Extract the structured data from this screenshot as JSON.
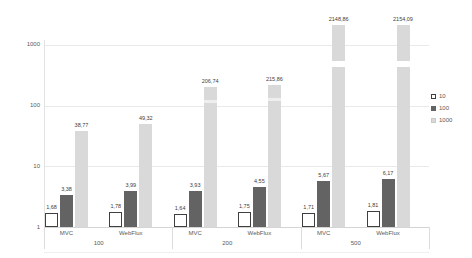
{
  "chart_data": {
    "type": "bar",
    "title": "",
    "xlabel": "",
    "ylabel": "",
    "y_axis": {
      "scale": "log10",
      "min": 1,
      "max": 3000,
      "tick_values": [
        1,
        10,
        100,
        1000
      ],
      "tick_labels": [
        "1",
        "10",
        "100",
        "1000"
      ]
    },
    "grid": "horizontal",
    "legend_position": "right",
    "series": [
      {
        "name": "10",
        "fill": "#ffffff",
        "stroke": "#3f3f3f"
      },
      {
        "name": "100",
        "fill": "#636363",
        "stroke": "#636363"
      },
      {
        "name": "1000",
        "fill": "#d9d9d9",
        "stroke": "#c9c9c9"
      }
    ],
    "groups": [
      {
        "label": "100",
        "subgroups": [
          {
            "label": "MVC",
            "values": [
              1.68,
              3.38,
              38.77
            ],
            "value_labels": [
              "1,68",
              "3,38",
              "38,77"
            ]
          },
          {
            "label": "WebFlux",
            "values": [
              1.78,
              3.99,
              49.32
            ],
            "value_labels": [
              "1,78",
              "3,99",
              "49,32"
            ]
          }
        ]
      },
      {
        "label": "200",
        "subgroups": [
          {
            "label": "MVC",
            "values": [
              1.64,
              3.93,
              206.74
            ],
            "value_labels": [
              "1,64",
              "3,93",
              "206,74"
            ]
          },
          {
            "label": "WebFlux",
            "values": [
              1.75,
              4.55,
              215.86
            ],
            "value_labels": [
              "1,75",
              "4,55",
              "215,86"
            ]
          }
        ]
      },
      {
        "label": "500",
        "subgroups": [
          {
            "label": "MVC",
            "values": [
              1.71,
              5.67,
              2148.86
            ],
            "value_labels": [
              "1,71",
              "5,67",
              "2148,86"
            ]
          },
          {
            "label": "WebFlux",
            "values": [
              1.81,
              6.17,
              2154.09
            ],
            "value_labels": [
              "1,81",
              "6,17",
              "2154,09"
            ]
          }
        ]
      }
    ],
    "colors": {
      "gridline": "#e9e9e9",
      "axis": "#d4d4d4",
      "text": "#595959",
      "value_label_text": "#404040"
    }
  }
}
